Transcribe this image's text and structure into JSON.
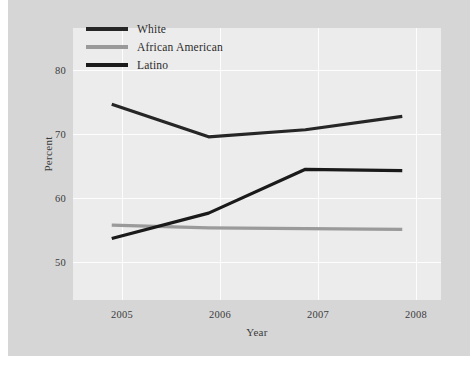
{
  "chart_data": {
    "type": "line",
    "title": "",
    "xlabel": "Year",
    "ylabel": "Percent",
    "categories": [
      "2005",
      "2006",
      "2007",
      "2008"
    ],
    "x": [
      2005,
      2006,
      2007,
      2008
    ],
    "xlim": [
      2004.6,
      2008.4
    ],
    "ylim": [
      45.5,
      84
    ],
    "yticks": [
      50,
      60,
      70,
      80
    ],
    "ytick_labels": [
      "50",
      "60",
      "70",
      "80"
    ],
    "xtick_labels": [
      "2005",
      "2006",
      "2007",
      "2008"
    ],
    "grid": true,
    "grid_color": "#fdfdfd",
    "legend_position": "upper-left-inside",
    "series": [
      {
        "name": "White",
        "color": "#262626",
        "values": [
          73.2,
          68.6,
          69.6,
          71.5
        ]
      },
      {
        "name": "African American",
        "color": "#9a9a9a",
        "values": [
          56.1,
          55.7,
          55.6,
          55.5
        ]
      },
      {
        "name": "Latino",
        "color": "#1a1a1a",
        "values": [
          54.2,
          57.8,
          64.0,
          63.8
        ]
      }
    ]
  },
  "legend": {
    "items": [
      {
        "label": "White",
        "color": "#262626"
      },
      {
        "label": "African American",
        "color": "#9a9a9a"
      },
      {
        "label": "Latino",
        "color": "#1a1a1a"
      }
    ]
  },
  "axes": {
    "x_title": "Year",
    "y_title": "Percent",
    "y_ticks": [
      "80",
      "70",
      "60",
      "50"
    ],
    "x_ticks": [
      "2005",
      "2006",
      "2007",
      "2008"
    ]
  },
  "colors": {
    "figure_background": "#d6d6d6",
    "panel_background": "#ececec",
    "gridline": "#fdfdfd",
    "text": "#3b3b3b"
  },
  "caption": {
    "text": ""
  }
}
